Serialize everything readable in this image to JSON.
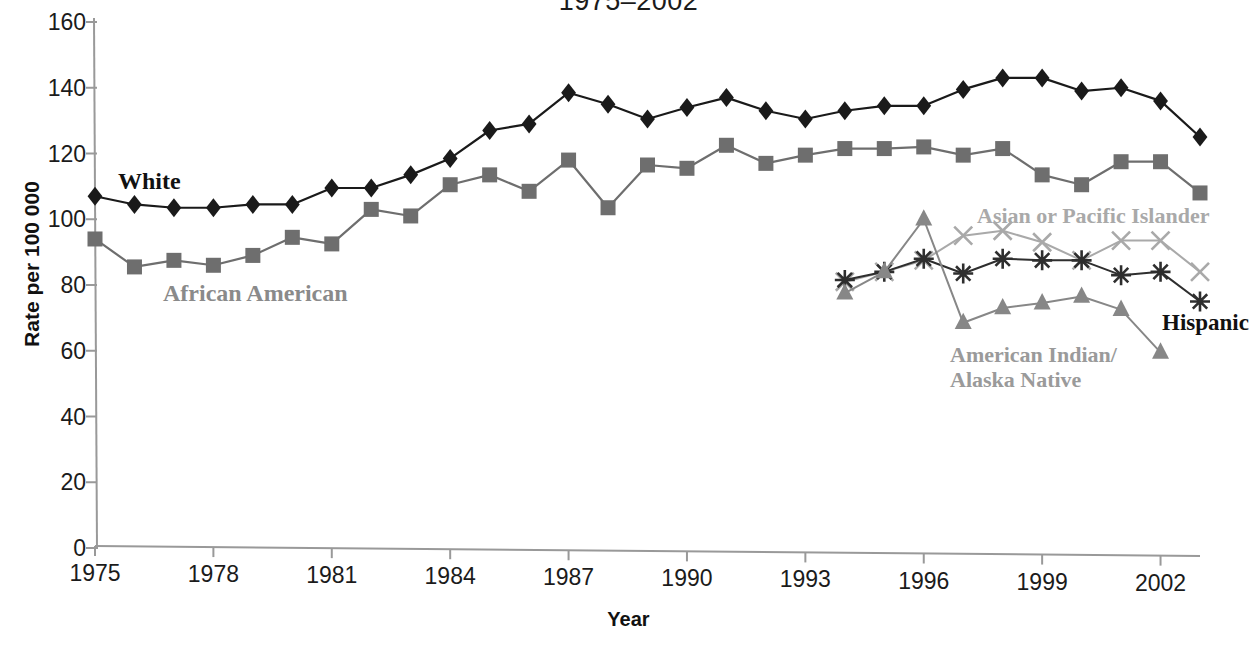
{
  "chart_data": {
    "type": "line",
    "title": "1975–2002",
    "xlabel": "Year",
    "ylabel": "Rate per 100 000",
    "xlim": [
      1975,
      2003
    ],
    "ylim": [
      0,
      160
    ],
    "ytick_step": 20,
    "yticks": [
      0,
      20,
      40,
      60,
      80,
      100,
      120,
      140,
      160
    ],
    "xticks": [
      1975,
      1978,
      1981,
      1984,
      1987,
      1990,
      1993,
      1996,
      1999,
      2002
    ],
    "grid": false,
    "legend_position": "inline-annotations",
    "series": [
      {
        "name": "White",
        "marker": "diamond",
        "color": "#1a1a1a",
        "x": [
          1975,
          1976,
          1977,
          1978,
          1979,
          1980,
          1981,
          1982,
          1983,
          1984,
          1985,
          1986,
          1987,
          1988,
          1989,
          1990,
          1991,
          1992,
          1993,
          1994,
          1995,
          1996,
          1997,
          1998,
          1999,
          2000,
          2001,
          2002,
          2003
        ],
        "values": [
          107,
          104.5,
          103.5,
          103.5,
          104.5,
          104.5,
          109.5,
          109.5,
          113.5,
          118.5,
          127,
          129,
          138.5,
          135,
          130.5,
          134,
          137,
          133,
          130.5,
          133,
          134.5,
          134.5,
          139.5,
          143,
          143,
          139,
          140,
          136,
          125
        ]
      },
      {
        "name": "African American",
        "marker": "square",
        "color": "#6e6e6e",
        "x": [
          1975,
          1976,
          1977,
          1978,
          1979,
          1980,
          1981,
          1982,
          1983,
          1984,
          1985,
          1986,
          1987,
          1988,
          1989,
          1990,
          1991,
          1992,
          1993,
          1994,
          1995,
          1996,
          1997,
          1998,
          1999,
          2000,
          2001,
          2002,
          2003
        ],
        "values": [
          94,
          85.5,
          87.5,
          86,
          89,
          94.5,
          92.5,
          103,
          101,
          110.5,
          113.5,
          108.5,
          118,
          103.5,
          116.5,
          115.5,
          122.5,
          117,
          119.5,
          121.5,
          121.5,
          122,
          119.5,
          121.5,
          113.5,
          110.5,
          117.5,
          117.5,
          108
        ]
      },
      {
        "name": "Asian or Pacific Islander",
        "marker": "x",
        "color": "#a9a9a9",
        "x": [
          1994,
          1995,
          1996,
          1997,
          1998,
          1999,
          2000,
          2001,
          2002,
          2003
        ],
        "values": [
          81,
          84,
          87.5,
          95,
          96.5,
          93,
          87.5,
          93.5,
          93.5,
          84
        ]
      },
      {
        "name": "Hispanic",
        "marker": "asterisk",
        "color": "#2e2e2e",
        "x": [
          1994,
          1995,
          1996,
          1997,
          1998,
          1999,
          2000,
          2001,
          2002,
          2003
        ],
        "values": [
          81.5,
          84,
          88,
          83.5,
          88,
          87.5,
          87.5,
          83,
          84,
          75
        ]
      },
      {
        "name": "American Indian/\nAlaska Native",
        "marker": "triangle",
        "color": "#878787",
        "x": [
          1994,
          1995,
          1996,
          1997,
          1998,
          1999,
          2000,
          2001,
          2002
        ],
        "values": [
          77.5,
          84,
          100,
          68.5,
          73,
          74.5,
          76.5,
          72.5,
          59.5
        ]
      }
    ],
    "annotations": [
      {
        "text": "White",
        "series": "White",
        "color": "#111111",
        "x": 118,
        "y": 168,
        "font_size": 24,
        "lines": 1
      },
      {
        "text": "African American",
        "series": "African American",
        "color": "#8a8a8a",
        "x": 163,
        "y": 280,
        "font_size": 24,
        "lines": 1
      },
      {
        "text": "Asian or Pacific Islander",
        "series": "Asian or Pacific Islander",
        "color": "#a9a9a9",
        "x": 977,
        "y": 204,
        "font_size": 22,
        "lines": 1
      },
      {
        "text": "Hispanic",
        "series": "Hispanic",
        "color": "#111111",
        "x": 1162,
        "y": 310,
        "font_size": 23,
        "lines": 1
      },
      {
        "text": "American Indian/\nAlaska Native",
        "series": "American Indian/Alaska Native",
        "color": "#9a9a9a",
        "x": 950,
        "y": 343,
        "font_size": 22,
        "lines": 2
      }
    ]
  },
  "axis": {
    "y_tick_labels": [
      "160",
      "140",
      "120",
      "100",
      "80",
      "60",
      "40",
      "20",
      "0"
    ],
    "x_tick_labels": [
      "1975",
      "1978",
      "1981",
      "1984",
      "1987",
      "1990",
      "1993",
      "1996",
      "1999",
      "2002"
    ]
  },
  "colors": {
    "white_series": "#1a1a1a",
    "african_american_series": "#6e6e6e",
    "asian_series": "#a9a9a9",
    "hispanic_series": "#2e2e2e",
    "american_indian_series": "#878787",
    "axis": "#999999",
    "text": "#1b1b1b"
  }
}
